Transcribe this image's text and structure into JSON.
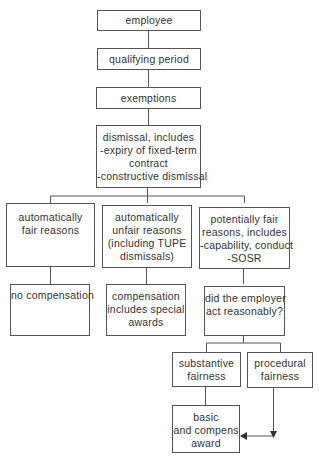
{
  "diagram": {
    "type": "flowchart",
    "nodes": {
      "employee": {
        "lines": [
          "employee"
        ]
      },
      "qualifying_period": {
        "lines": [
          "qualifying period"
        ]
      },
      "exemptions": {
        "lines": [
          "exemptions"
        ]
      },
      "dismissal": {
        "lines": [
          "dismissal, includes",
          "-expiry of fixed-term",
          "contract",
          "-constructive dismissal"
        ]
      },
      "auto_fair": {
        "lines": [
          "automatically",
          "fair reasons"
        ]
      },
      "auto_unfair": {
        "lines": [
          "automatically",
          "unfair reasons",
          "(including TUPE",
          "dismissals)"
        ]
      },
      "potentially_fair": {
        "lines": [
          "potentially fair",
          "reasons, includes",
          "-capability, conduct",
          "-SOSR"
        ]
      },
      "no_compensation": {
        "lines": [
          "no compensation"
        ]
      },
      "compensation_special": {
        "lines": [
          "compensation",
          "includes special",
          "awards"
        ]
      },
      "act_reasonably": {
        "lines": [
          "did the employer",
          "act reasonably?"
        ]
      },
      "substantive_fairness": {
        "lines": [
          "substantive",
          "fairness"
        ]
      },
      "procedural_fairness": {
        "lines": [
          "procedural",
          "fairness"
        ]
      },
      "basic_award": {
        "lines": [
          "basic",
          "and compens",
          "award"
        ]
      }
    },
    "edges": [
      [
        "employee",
        "qualifying_period"
      ],
      [
        "qualifying_period",
        "exemptions"
      ],
      [
        "exemptions",
        "dismissal"
      ],
      [
        "dismissal",
        "auto_fair"
      ],
      [
        "dismissal",
        "auto_unfair"
      ],
      [
        "dismissal",
        "potentially_fair"
      ],
      [
        "auto_fair",
        "no_compensation"
      ],
      [
        "auto_unfair",
        "compensation_special"
      ],
      [
        "potentially_fair",
        "act_reasonably"
      ],
      [
        "act_reasonably",
        "substantive_fairness"
      ],
      [
        "act_reasonably",
        "procedural_fairness"
      ],
      [
        "substantive_fairness",
        "basic_award"
      ],
      [
        "procedural_fairness",
        "basic_award"
      ]
    ]
  }
}
